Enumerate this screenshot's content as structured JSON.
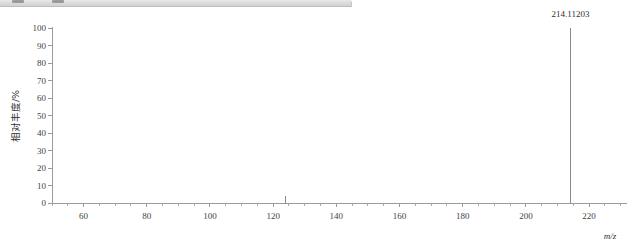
{
  "toolbar": {
    "name": "clipped-toolbar-strip",
    "marks": [
      "toolbar-mark",
      "toolbar-mark"
    ]
  },
  "chart_data": {
    "type": "bar",
    "title": "",
    "subtitle": "",
    "xlabel": "m/z",
    "ylabel": "相对丰度/%",
    "xlim": [
      50,
      232
    ],
    "ylim": [
      0,
      100
    ],
    "grid": false,
    "legend": null,
    "x_ticks": [
      60,
      80,
      100,
      120,
      140,
      160,
      180,
      200,
      220
    ],
    "x_tick_labels": [
      "60",
      "80",
      "100",
      "120",
      "140",
      "160",
      "180",
      "200",
      "220"
    ],
    "x_minor_tick_step": 5,
    "y_ticks": [
      0,
      10,
      20,
      30,
      40,
      50,
      60,
      70,
      80,
      90,
      100
    ],
    "y_tick_labels": [
      "0",
      "10",
      "20",
      "30",
      "40",
      "50",
      "60",
      "70",
      "80",
      "90",
      "100"
    ],
    "x": [
      124.0,
      214.11203
    ],
    "values": [
      4,
      100
    ],
    "annotations": [
      {
        "text": "214.11203",
        "x": 214.11203,
        "y": 100
      }
    ],
    "base_peak_label": "214.11203",
    "series": [
      {
        "name": "mass spectrum",
        "x": [
          124.0,
          214.11203
        ],
        "values": [
          4,
          100
        ]
      }
    ]
  },
  "colors": {
    "axis": "#9a9a9a",
    "peak": "#8a8a8a",
    "text": "#3f3f3f",
    "toolbar_bg": "#dcdcdc",
    "background": "#ffffff"
  }
}
